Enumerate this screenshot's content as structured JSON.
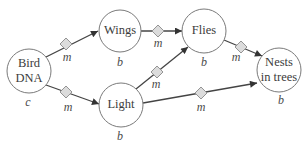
{
  "diagram": {
    "type": "causal-network",
    "nodes": [
      {
        "id": "bird_dna",
        "lines": [
          "Bird",
          "DNA"
        ],
        "type_label": "c",
        "cx": 29,
        "cy": 71,
        "r": 22
      },
      {
        "id": "wings",
        "lines": [
          "Wings"
        ],
        "type_label": "b",
        "cx": 120,
        "cy": 31,
        "r": 21
      },
      {
        "id": "flies",
        "lines": [
          "Flies"
        ],
        "type_label": "b",
        "cx": 204,
        "cy": 31,
        "r": 22
      },
      {
        "id": "light",
        "lines": [
          "Light"
        ],
        "type_label": "b",
        "cx": 121,
        "cy": 105,
        "r": 22
      },
      {
        "id": "nests",
        "lines": [
          "Nests",
          "in trees"
        ],
        "type_label": "b",
        "cx": 279,
        "cy": 70,
        "r": 22
      }
    ],
    "edges": [
      {
        "from": "bird_dna",
        "to": "wings",
        "label": "m"
      },
      {
        "from": "bird_dna",
        "to": "light",
        "label": "m"
      },
      {
        "from": "wings",
        "to": "flies",
        "label": "m"
      },
      {
        "from": "light",
        "to": "flies",
        "label": "m"
      },
      {
        "from": "flies",
        "to": "nests",
        "label": "m"
      },
      {
        "from": "light",
        "to": "nests",
        "label": "m"
      }
    ]
  },
  "labels": {
    "bird_dna_line1": "Bird",
    "bird_dna_line2": "DNA",
    "bird_dna_type": "c",
    "wings": "Wings",
    "wings_type": "b",
    "flies": "Flies",
    "flies_type": "b",
    "light": "Light",
    "light_type": "b",
    "nests_line1": "Nests",
    "nests_line2": "in trees",
    "nests_type": "b",
    "edge_bird_wings": "m",
    "edge_bird_light": "m",
    "edge_wings_flies": "m",
    "edge_light_flies": "m",
    "edge_flies_nests": "m",
    "edge_light_nests": "m"
  }
}
